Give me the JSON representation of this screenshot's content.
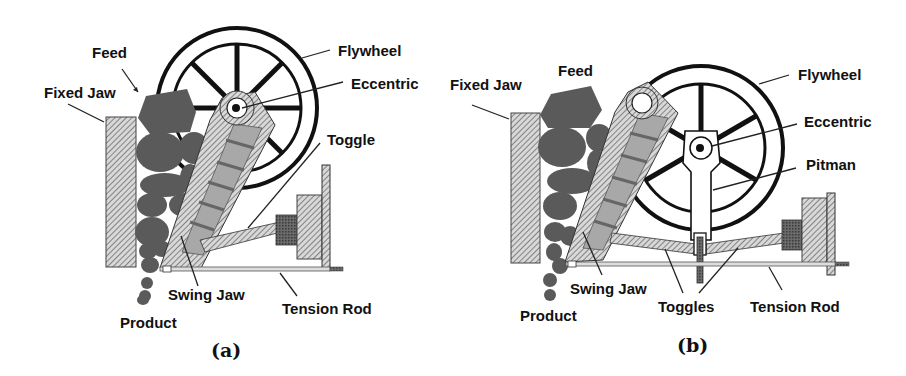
{
  "figure": {
    "panels": [
      {
        "id": "a",
        "caption": "(a)",
        "title": "Single-toggle jaw crusher",
        "labels": {
          "feed": "Feed",
          "fixed_jaw": "Fixed Jaw",
          "flywheel": "Flywheel",
          "eccentric": "Eccentric",
          "toggle": "Toggle",
          "swing_jaw": "Swing Jaw",
          "tension_rod": "Tension Rod",
          "product": "Product"
        }
      },
      {
        "id": "b",
        "caption": "(b)",
        "title": "Double-toggle jaw crusher",
        "labels": {
          "feed": "Feed",
          "fixed_jaw": "Fixed Jaw",
          "flywheel": "Flywheel",
          "eccentric": "Eccentric",
          "pitman": "Pitman",
          "swing_jaw": "Swing Jaw",
          "toggles": "Toggles",
          "tension_rod": "Tension Rod",
          "product": "Product"
        }
      }
    ],
    "colors": {
      "rock": "#5a5a5a",
      "jaw_fill": "#a8a8a8",
      "hatch_dark": "#333333",
      "line": "#111111",
      "background": "#ffffff"
    }
  }
}
